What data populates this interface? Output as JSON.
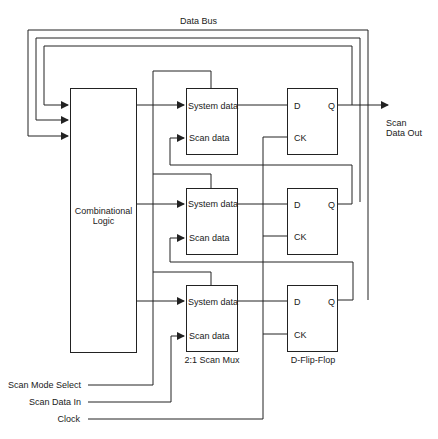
{
  "diagram": {
    "bus_label": "Data Bus",
    "combinational_logic": {
      "line1": "Combinational",
      "line2": "Logic"
    },
    "muxes": [
      {
        "system_label": "System data",
        "scan_label": "Scan data"
      },
      {
        "system_label": "System data",
        "scan_label": "Scan data"
      },
      {
        "system_label": "System data",
        "scan_label": "Scan data"
      }
    ],
    "mux_caption": "2:1 Scan Mux",
    "flip_flops": [
      {
        "d_label": "D",
        "q_label": "Q",
        "ck_label": "CK"
      },
      {
        "d_label": "D",
        "q_label": "Q",
        "ck_label": "CK"
      },
      {
        "d_label": "D",
        "q_label": "Q",
        "ck_label": "CK"
      }
    ],
    "ff_caption": "D-Flip-Flop",
    "output_label": {
      "line1": "Scan",
      "line2": "Data Out"
    },
    "inputs": [
      {
        "label": "Scan Mode Select"
      },
      {
        "label": "Scan Data In"
      },
      {
        "label": "Clock"
      }
    ],
    "colors": {
      "line": "#222222",
      "background": "#ffffff"
    }
  }
}
